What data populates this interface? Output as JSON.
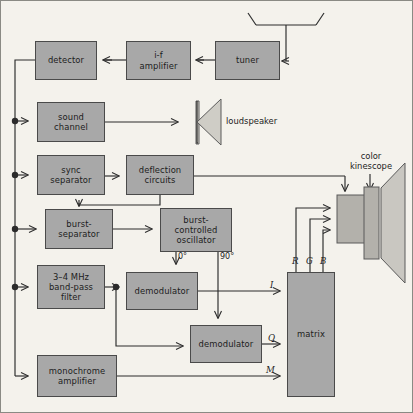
{
  "diagram": {
    "colors": {
      "background": "#f4f2ec",
      "block_fill": "#a8a8a8",
      "block_stroke": "#4a4a4a",
      "line": "#2b2b2b",
      "frame": "#8a8a84"
    },
    "blocks": [
      {
        "id": "detector",
        "label": "detector",
        "x": 35,
        "y": 41,
        "w": 62,
        "h": 39
      },
      {
        "id": "if_amp",
        "label": "i-f\namplifier",
        "x": 126,
        "y": 41,
        "w": 65,
        "h": 39
      },
      {
        "id": "tuner",
        "label": "tuner",
        "x": 215,
        "y": 41,
        "w": 65,
        "h": 39
      },
      {
        "id": "sound",
        "label": "sound\nchannel",
        "x": 37,
        "y": 102,
        "w": 68,
        "h": 40
      },
      {
        "id": "sync_sep",
        "label": "sync\nseparator",
        "x": 37,
        "y": 155,
        "w": 68,
        "h": 40
      },
      {
        "id": "deflection",
        "label": "deflection\ncircuits",
        "x": 126,
        "y": 155,
        "w": 68,
        "h": 40
      },
      {
        "id": "burst_sep",
        "label": "burst-\nseparator",
        "x": 45,
        "y": 209,
        "w": 68,
        "h": 40
      },
      {
        "id": "bco",
        "label": "burst-\ncontrolled\noscillator",
        "x": 160,
        "y": 208,
        "w": 72,
        "h": 44
      },
      {
        "id": "bpf",
        "label": "3–4  MHz\nband-pass\nfilter",
        "x": 37,
        "y": 265,
        "w": 68,
        "h": 44
      },
      {
        "id": "demod_i",
        "label": "demodulator",
        "x": 126,
        "y": 272,
        "w": 72,
        "h": 38
      },
      {
        "id": "demod_q",
        "label": "demodulator",
        "x": 190,
        "y": 325,
        "w": 72,
        "h": 38
      },
      {
        "id": "mono_amp",
        "label": "monochrome\namplifier",
        "x": 37,
        "y": 355,
        "w": 80,
        "h": 42
      },
      {
        "id": "matrix",
        "label": "matrix",
        "x": 287,
        "y": 272,
        "w": 48,
        "h": 125
      }
    ],
    "labels": {
      "loudspeaker": "loudspeaker",
      "color_kinescope": "color\nkinescope"
    },
    "signals": {
      "i": "I",
      "q": "Q",
      "m": "M",
      "r": "R",
      "g": "G",
      "b": "B"
    },
    "phase_taps": {
      "zero": "0°",
      "ninety": "90°"
    },
    "icons": {
      "antenna": "dipole-antenna-icon",
      "loudspeaker": "loudspeaker-icon",
      "kinescope": "crt-kinescope-icon"
    }
  }
}
